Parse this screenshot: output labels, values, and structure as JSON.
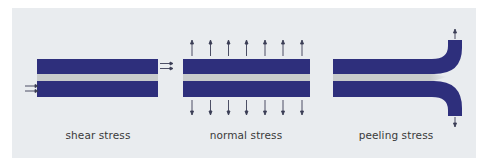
{
  "figure": {
    "background_color": "#e9ecef",
    "substrate_color": "#2e2f7c",
    "adhesive_color": "#c9cccc",
    "arrow_color": "#3a3d55",
    "panels": [
      {
        "id": "shear",
        "label": "shear stress",
        "arrow_count": 4
      },
      {
        "id": "normal",
        "label": "normal stress",
        "arrows_top": 7,
        "arrows_bottom": 7
      },
      {
        "id": "peeling",
        "label": "peeling stress",
        "arrows_top": 1,
        "arrows_bottom": 1
      }
    ]
  }
}
